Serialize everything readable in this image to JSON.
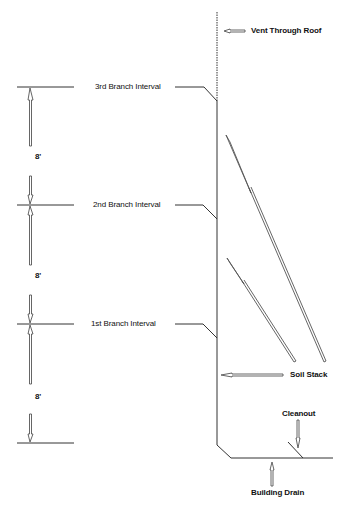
{
  "diagram": {
    "type": "plumbing-stack-elevation",
    "labels": {
      "vent": "Vent Through Roof",
      "branch3": "3rd Branch Interval",
      "branch2": "2nd Branch Interval",
      "branch1": "1st Branch Interval",
      "soil_stack": "Soil Stack",
      "cleanout": "Cleanout",
      "building_drain": "Building Drain"
    },
    "dimensions": [
      {
        "id": "dim-top",
        "value": "8'"
      },
      {
        "id": "dim-mid",
        "value": "8'"
      },
      {
        "id": "dim-bottom",
        "value": "8'"
      }
    ],
    "colors": {
      "line": "#333333",
      "text": "#111111",
      "background": "#ffffff"
    }
  }
}
